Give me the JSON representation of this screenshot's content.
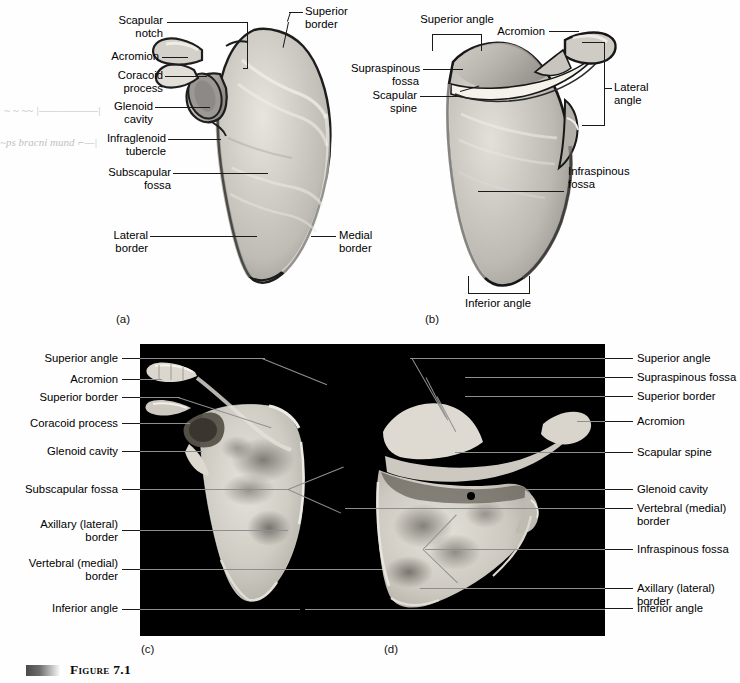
{
  "figure": {
    "caption": "Figure 7.1",
    "sub_labels": [
      "(a)",
      "(b)",
      "(c)",
      "(d)"
    ]
  },
  "panel_a": {
    "letter": "(a)",
    "labels": [
      {
        "id": "scapular-notch",
        "text": "Scapular\nnotch"
      },
      {
        "id": "acromion",
        "text": "Acromion"
      },
      {
        "id": "coracoid-process",
        "text": "Coracoid\nprocess"
      },
      {
        "id": "glenoid-cavity",
        "text": "Glenoid\ncavity"
      },
      {
        "id": "infraglenoid-tubercle",
        "text": "Infraglenoid\ntubercle"
      },
      {
        "id": "subscapular-fossa",
        "text": "Subscapular\nfossa"
      },
      {
        "id": "lateral-border",
        "text": "Lateral\nborder"
      },
      {
        "id": "superior-border",
        "text": "Superior\nborder"
      },
      {
        "id": "medial-border",
        "text": "Medial\nborder"
      }
    ]
  },
  "panel_b": {
    "letter": "(b)",
    "labels": [
      {
        "id": "superior-angle",
        "text": "Superior angle"
      },
      {
        "id": "acromion",
        "text": "Acromion"
      },
      {
        "id": "supraspinous-fossa",
        "text": "Supraspinous\nfossa"
      },
      {
        "id": "scapular-spine",
        "text": "Scapular\nspine"
      },
      {
        "id": "lateral-angle",
        "text": "Lateral\nangle"
      },
      {
        "id": "infraspinous-fossa",
        "text": "Infraspinous\nfossa"
      },
      {
        "id": "inferior-angle",
        "text": "Inferior angle"
      }
    ]
  },
  "panel_c": {
    "letter": "(c)",
    "labels": [
      {
        "id": "superior-angle",
        "text": "Superior angle"
      },
      {
        "id": "acromion",
        "text": "Acromion"
      },
      {
        "id": "superior-border",
        "text": "Superior border"
      },
      {
        "id": "coracoid-process",
        "text": "Coracoid process"
      },
      {
        "id": "glenoid-cavity",
        "text": "Glenoid cavity"
      },
      {
        "id": "subscapular-fossa",
        "text": "Subscapular fossa"
      },
      {
        "id": "axillary-lateral-border",
        "text": "Axillary (lateral)\nborder"
      },
      {
        "id": "vertebral-medial-border",
        "text": "Vertebral (medial)\nborder"
      },
      {
        "id": "inferior-angle",
        "text": "Inferior angle"
      }
    ]
  },
  "panel_d": {
    "letter": "(d)",
    "labels": [
      {
        "id": "superior-angle",
        "text": "Superior angle"
      },
      {
        "id": "supraspinous-fossa",
        "text": "Supraspinous fossa"
      },
      {
        "id": "superior-border",
        "text": "Superior border"
      },
      {
        "id": "acromion",
        "text": "Acromion"
      },
      {
        "id": "scapular-spine",
        "text": "Scapular spine"
      },
      {
        "id": "glenoid-cavity",
        "text": "Glenoid cavity"
      },
      {
        "id": "vertebral-medial-border",
        "text": "Vertebral (medial)\nborder"
      },
      {
        "id": "infraspinous-fossa",
        "text": "Infraspinous fossa"
      },
      {
        "id": "axillary-lateral-border",
        "text": "Axillary (lateral)\nborder"
      },
      {
        "id": "inferior-angle",
        "text": "Inferior angle"
      }
    ]
  },
  "annotations": {
    "pencil_1": "~ ~ ~~  |——————|",
    "pencil_2": "~ps  bracni  mund  ⌐—|"
  },
  "colors": {
    "photo_background": "#000000",
    "leader_line": "#1a1a1a",
    "panel_leader_line": "#8f8f8f",
    "bone_light": "#d8d5cf",
    "bone_mid": "#a9a6a0",
    "bone_shadow": "#76736e",
    "text": "#000000"
  }
}
